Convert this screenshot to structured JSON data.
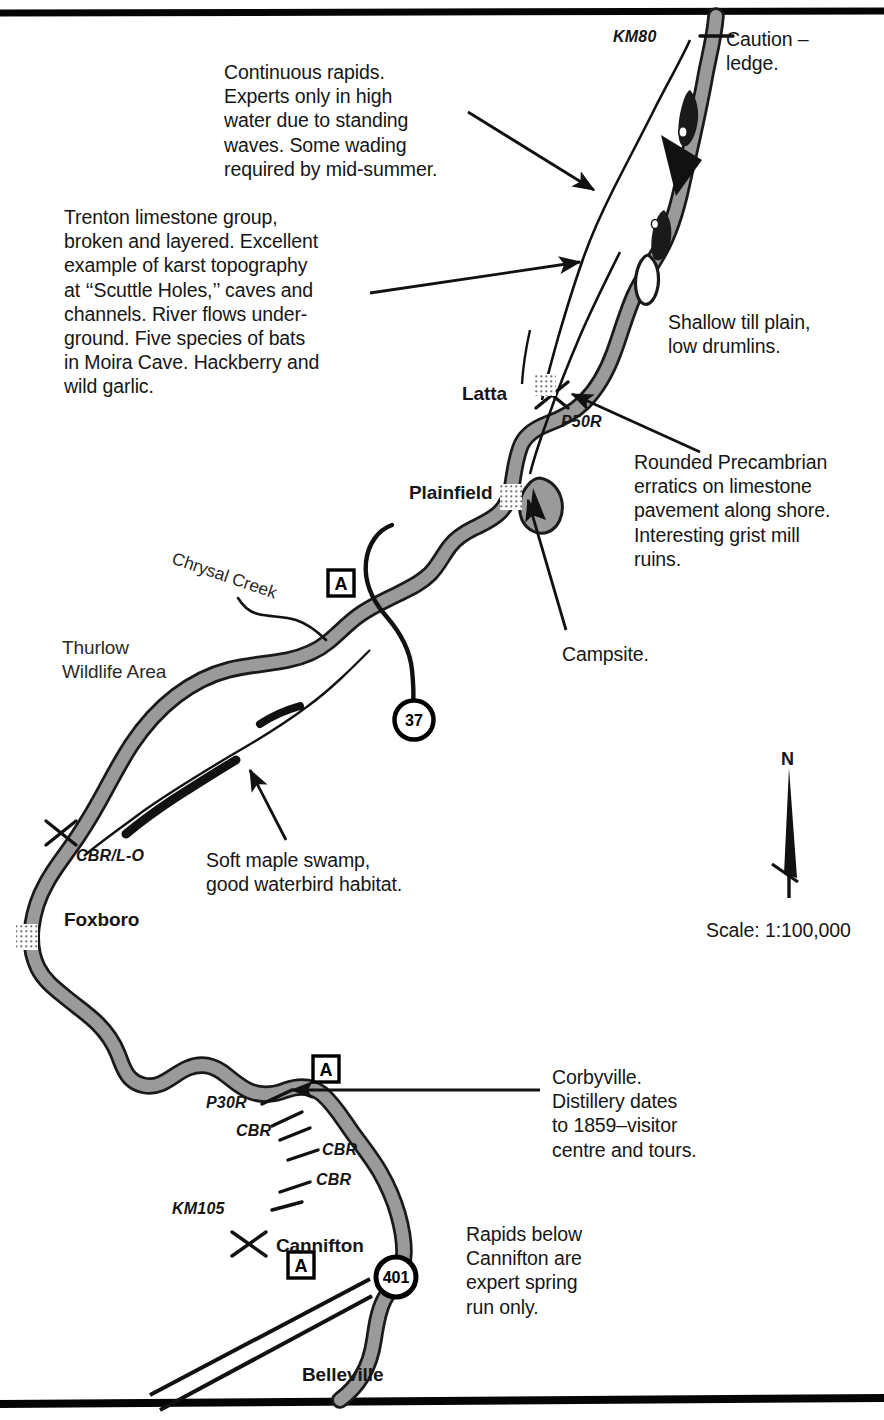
{
  "map": {
    "title": "Moira River canoe route map – Belleville to KM80",
    "scale_label": "Scale: 1:100,000",
    "north_label": "N",
    "river_color": "#9a9a9a",
    "river_outline_color": "#1a1a1a",
    "text_color": "#161616",
    "border_color": "#000000"
  },
  "notes": [
    {
      "id": "continuous-rapids",
      "text": "Continuous rapids.\nExperts only in high\nwater due to standing\nwaves. Some wading\nrequired by mid-summer."
    },
    {
      "id": "trenton-limestone",
      "text": "Trenton limestone group,\nbroken and layered. Excellent\nexample of karst topography\nat ‘‘Scuttle Holes,’’ caves and\nchannels. River flows under-\nground. Five species of bats\nin Moira Cave. Hackberry and\nwild garlic."
    },
    {
      "id": "caution-ledge",
      "text": "Caution –\nledge."
    },
    {
      "id": "shallow-till-plain",
      "text": "Shallow till plain,\nlow drumlins."
    },
    {
      "id": "rounded-precambrian",
      "text": "Rounded Precambrian\nerratics on limestone\npavement along shore.\nInteresting grist mill\nruins."
    },
    {
      "id": "campsite",
      "text": "Campsite."
    },
    {
      "id": "soft-maple-swamp",
      "text": "Soft maple swamp,\ngood waterbird habitat."
    },
    {
      "id": "corbyville",
      "text": "Corbyville.\nDistillery dates\nto 1859–visitor\ncentre and tours."
    },
    {
      "id": "rapids-below-cannifton",
      "text": "Rapids below\nCannifton are\nexpert spring\nrun only."
    }
  ],
  "towns": [
    {
      "id": "latta",
      "label": "Latta"
    },
    {
      "id": "plainfield",
      "label": "Plainfield"
    },
    {
      "id": "foxboro",
      "label": "Foxboro"
    },
    {
      "id": "cannifton",
      "label": "Cannifton"
    },
    {
      "id": "belleville",
      "label": "Belleville"
    }
  ],
  "areas": [
    {
      "id": "thurlow-wildlife-area",
      "label": "Thurlow\nWildlife Area"
    },
    {
      "id": "chrysal-creek",
      "label": "Chrysal Creek"
    }
  ],
  "river_markers": [
    {
      "id": "km80",
      "label": "KM80"
    },
    {
      "id": "p50r",
      "label": "P50R"
    },
    {
      "id": "cbr-lo",
      "label": "CBR/L-O"
    },
    {
      "id": "p30r",
      "label": "P30R"
    },
    {
      "id": "cbr-1",
      "label": "CBR"
    },
    {
      "id": "cbr-2",
      "label": "CBR"
    },
    {
      "id": "cbr-3",
      "label": "CBR"
    },
    {
      "id": "km105",
      "label": "KM105"
    }
  ],
  "access_points": [
    {
      "id": "access-a-plainfield",
      "label": "A"
    },
    {
      "id": "access-a-corbyville",
      "label": "A"
    },
    {
      "id": "access-a-belleville",
      "label": "A"
    }
  ],
  "highways": [
    {
      "id": "highway-37",
      "label": "37"
    },
    {
      "id": "highway-401",
      "label": "401"
    }
  ]
}
